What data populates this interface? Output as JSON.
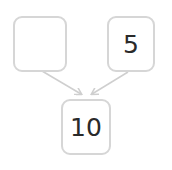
{
  "diagram": {
    "type": "number-bond",
    "parts": [
      {
        "id": "left",
        "value": ""
      },
      {
        "id": "right",
        "value": "5"
      }
    ],
    "whole": {
      "value": "10"
    },
    "colors": {
      "border": "#d6d6d6",
      "arrow": "#cfcfcf",
      "text": "#2a2a2a"
    }
  }
}
